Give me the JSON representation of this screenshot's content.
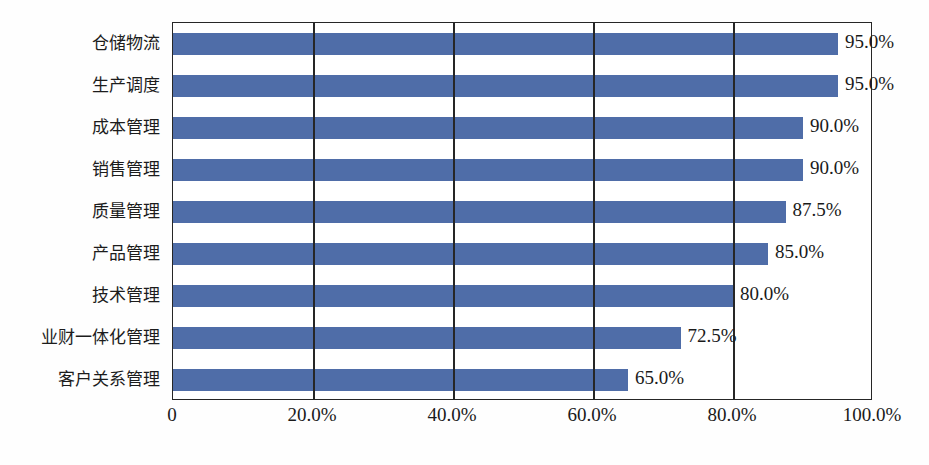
{
  "chart_data": {
    "type": "bar",
    "orientation": "horizontal",
    "title": "",
    "subtitle": "",
    "xlabel": "",
    "ylabel": "",
    "xlim": [
      0,
      100
    ],
    "grid": true,
    "legend": "none",
    "categories": [
      "仓储物流",
      "生产调度",
      "成本管理",
      "销售管理",
      "质量管理",
      "产品管理",
      "技术管理",
      "业财一体化管理",
      "客户关系管理"
    ],
    "values": [
      95.0,
      95.0,
      90.0,
      90.0,
      87.5,
      85.0,
      80.0,
      72.5,
      65.0
    ],
    "value_labels": [
      "95.0%",
      "95.0%",
      "90.0%",
      "90.0%",
      "87.5%",
      "85.0%",
      "80.0%",
      "72.5%",
      "65.0%"
    ],
    "x_ticks": [
      0,
      20,
      40,
      60,
      80,
      100
    ],
    "x_tick_labels": [
      "0",
      "20.0%",
      "40.0%",
      "60.0%",
      "80.0%",
      "100.0%"
    ],
    "series_color": "#4f6da8",
    "axis_color": "#262626",
    "text_color": "#1a1a1a"
  }
}
